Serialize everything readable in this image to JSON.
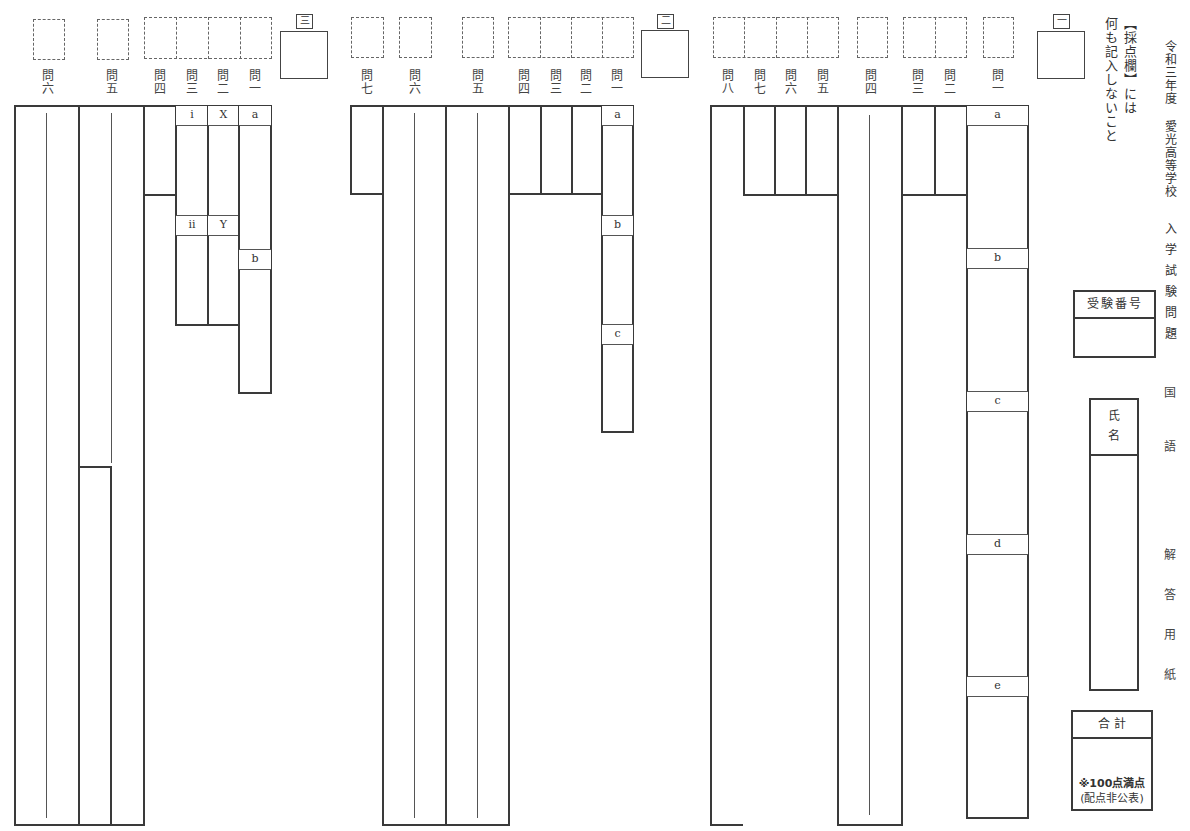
{
  "title": {
    "year": "令和三年度",
    "school": "愛光高等学校",
    "exam": "入学試験問題",
    "subject_1": "国",
    "subject_2": "語",
    "sheet_1": "解",
    "sheet_2": "答",
    "sheet_3": "用",
    "sheet_4": "紙"
  },
  "notice": {
    "line1": "【採点欄】には",
    "line2": "何も記入しないこと"
  },
  "side": {
    "exam_number_label": "受験番号",
    "name_label_1": "氏",
    "name_label_2": "名",
    "total_label": "合 計",
    "total_note_1": "※100点満点",
    "total_note_2": "(配点非公表)"
  },
  "sections": {
    "s1": {
      "marker": "一",
      "questions": {
        "q1": [
          "問",
          "一"
        ],
        "q2": [
          "問",
          "二"
        ],
        "q3": [
          "問",
          "三"
        ],
        "q4": [
          "問",
          "四"
        ],
        "q5": [
          "問",
          "五"
        ],
        "q6": [
          "問",
          "六"
        ],
        "q7": [
          "問",
          "七"
        ],
        "q8": [
          "問",
          "八"
        ]
      },
      "q1_parts": [
        "a",
        "b",
        "c",
        "d",
        "e"
      ]
    },
    "s2": {
      "marker": "二",
      "questions": {
        "q1": [
          "問",
          "一"
        ],
        "q2": [
          "問",
          "二"
        ],
        "q3": [
          "問",
          "三"
        ],
        "q4": [
          "問",
          "四"
        ],
        "q5": [
          "問",
          "五"
        ],
        "q6": [
          "問",
          "六"
        ],
        "q7": [
          "問",
          "七"
        ]
      },
      "q1_parts": [
        "a",
        "b",
        "c"
      ]
    },
    "s3": {
      "marker": "三",
      "questions": {
        "q1": [
          "問",
          "一"
        ],
        "q2": [
          "問",
          "二"
        ],
        "q3": [
          "問",
          "三"
        ],
        "q4": [
          "問",
          "四"
        ],
        "q5": [
          "問",
          "五"
        ],
        "q6": [
          "問",
          "六"
        ]
      },
      "q1_parts": [
        "a",
        "b"
      ],
      "q2_parts": [
        "X",
        "Y"
      ],
      "q3_parts": [
        "i",
        "ii"
      ]
    }
  }
}
